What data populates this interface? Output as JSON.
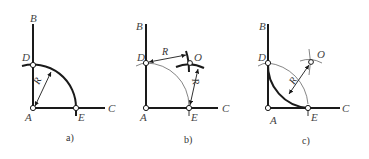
{
  "figure": {
    "panels": [
      {
        "caption": "a)",
        "labels": {
          "B": "B",
          "D": "D",
          "A": "A",
          "E": "E",
          "C": "C",
          "R": "R"
        }
      },
      {
        "caption": "b)",
        "labels": {
          "B": "B",
          "D": "D",
          "A": "A",
          "E": "E",
          "C": "C",
          "O": "O",
          "R1": "R",
          "R2": "R"
        }
      },
      {
        "caption": "c)",
        "labels": {
          "B": "B",
          "D": "D",
          "A": "A",
          "E": "E",
          "C": "C",
          "O": "O",
          "R": "R"
        }
      }
    ],
    "colors": {
      "line": "#1a1a1a",
      "label": "#444444",
      "background": "#ffffff"
    }
  }
}
